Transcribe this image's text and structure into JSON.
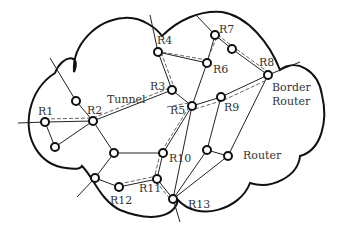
{
  "diagram": {
    "type": "network-topology",
    "colors": {
      "stroke": "#111111",
      "link": "#222222",
      "tunnel": "#555555",
      "node_fill": "#ffffff",
      "label": "#333333"
    },
    "labels": {
      "tunnel": "Tunnel",
      "border_router_line1": "Border",
      "border_router_line2": "Router",
      "router": "Router"
    },
    "nodes": [
      {
        "id": "R1",
        "label": "R1",
        "x": 45,
        "y": 122
      },
      {
        "id": "R2",
        "label": "R2",
        "x": 93,
        "y": 121
      },
      {
        "id": "R3",
        "label": "R3",
        "x": 172,
        "y": 90
      },
      {
        "id": "R4",
        "label": "R4",
        "x": 158,
        "y": 52
      },
      {
        "id": "R5",
        "label": "R5",
        "x": 192,
        "y": 106
      },
      {
        "id": "R6",
        "label": "R6",
        "x": 207,
        "y": 63
      },
      {
        "id": "R7",
        "label": "R7",
        "x": 215,
        "y": 35
      },
      {
        "id": "R8",
        "label": "R8",
        "x": 268,
        "y": 75
      },
      {
        "id": "R9",
        "label": "R9",
        "x": 221,
        "y": 97
      },
      {
        "id": "R10",
        "label": "R10",
        "x": 163,
        "y": 153
      },
      {
        "id": "R11",
        "label": "R11",
        "x": 157,
        "y": 179
      },
      {
        "id": "R12",
        "label": "R12",
        "x": 119,
        "y": 187
      },
      {
        "id": "R13",
        "label": "R13",
        "x": 173,
        "y": 199
      },
      {
        "id": "U1",
        "label": "",
        "x": 76,
        "y": 101
      },
      {
        "id": "U2",
        "label": "",
        "x": 55,
        "y": 147
      },
      {
        "id": "U3",
        "label": "",
        "x": 114,
        "y": 153
      },
      {
        "id": "U4",
        "label": "",
        "x": 95,
        "y": 178
      },
      {
        "id": "U5",
        "label": "",
        "x": 232,
        "y": 49
      },
      {
        "id": "U6",
        "label": "",
        "x": 207,
        "y": 150
      },
      {
        "id": "Router",
        "label": "",
        "x": 228,
        "y": 156
      }
    ],
    "links": [
      [
        "R1",
        "R2"
      ],
      [
        "R1",
        "U2"
      ],
      [
        "U2",
        "R2"
      ],
      [
        "U1",
        "R2"
      ],
      [
        "R2",
        "R3"
      ],
      [
        "R2",
        "U3"
      ],
      [
        "R3",
        "R4"
      ],
      [
        "R3",
        "R5"
      ],
      [
        "R4",
        "R6"
      ],
      [
        "R6",
        "R7"
      ],
      [
        "R6",
        "R5"
      ],
      [
        "R7",
        "U5"
      ],
      [
        "U5",
        "R8"
      ],
      [
        "R5",
        "R9"
      ],
      [
        "R9",
        "R8"
      ],
      [
        "R5",
        "R10"
      ],
      [
        "R10",
        "R11"
      ],
      [
        "U3",
        "R10"
      ],
      [
        "U3",
        "U4"
      ],
      [
        "U4",
        "R12"
      ],
      [
        "R12",
        "R11"
      ],
      [
        "R11",
        "R13"
      ],
      [
        "R9",
        "U6"
      ],
      [
        "U6",
        "Router"
      ],
      [
        "R8",
        "Router"
      ],
      [
        "U6",
        "R13"
      ],
      [
        "Router",
        "R13"
      ],
      [
        "R5",
        "R13"
      ]
    ],
    "tunnel_path": [
      "R1",
      "R2",
      "R3",
      "R4",
      "R6",
      "R7",
      "U5",
      "R8"
    ],
    "tunnel_path2": [
      "R2",
      "R5",
      "R9",
      "R8"
    ],
    "tunnel_path3": [
      "R12",
      "R11",
      "R13"
    ]
  }
}
